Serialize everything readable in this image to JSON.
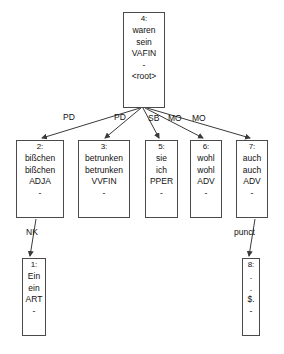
{
  "diagram": {
    "line_color": "#3a3a3a",
    "box_border_color": "#4a4a4a",
    "background": "#ffffff",
    "text_color": "#111111"
  },
  "nodes": [
    {
      "id": "node-4",
      "index": "4:",
      "form": "waren",
      "lemma": "sein",
      "pos": "VAFIN",
      "feats": "-",
      "deprel": "<root>",
      "x": 123,
      "y": 12,
      "w": 42,
      "h": 96
    },
    {
      "id": "node-2",
      "index": "2:",
      "form": "bißchen",
      "lemma": "bißchen",
      "pos": "ADJA",
      "feats": "-",
      "deprel": "",
      "x": 16,
      "y": 140,
      "w": 48,
      "h": 78
    },
    {
      "id": "node-3",
      "index": "3:",
      "form": "betrunken",
      "lemma": "betrunken",
      "pos": "VVFIN",
      "feats": "-",
      "deprel": "",
      "x": 78,
      "y": 140,
      "w": 52,
      "h": 78
    },
    {
      "id": "node-5",
      "index": "5:",
      "form": "sie",
      "lemma": "ich",
      "pos": "PPER",
      "feats": "-",
      "deprel": "",
      "x": 145,
      "y": 140,
      "w": 33,
      "h": 78
    },
    {
      "id": "node-6",
      "index": "6:",
      "form": "wohl",
      "lemma": "wohl",
      "pos": "ADV",
      "feats": "-",
      "deprel": "",
      "x": 190,
      "y": 140,
      "w": 32,
      "h": 78
    },
    {
      "id": "node-7",
      "index": "7:",
      "form": "auch",
      "lemma": "auch",
      "pos": "ADV",
      "feats": "-",
      "deprel": "",
      "x": 236,
      "y": 140,
      "w": 32,
      "h": 78
    },
    {
      "id": "node-1",
      "index": "1:",
      "form": "Ein",
      "lemma": "ein",
      "pos": "ART",
      "feats": "-",
      "deprel": "",
      "x": 22,
      "y": 258,
      "w": 24,
      "h": 78
    },
    {
      "id": "node-8",
      "index": "8:",
      "form": ".",
      "lemma": ".",
      "pos": "$.",
      "feats": "-",
      "deprel": "",
      "x": 242,
      "y": 258,
      "w": 18,
      "h": 78
    }
  ],
  "edges": [
    {
      "id": "edge-4-2",
      "label": "PD",
      "from": "node-4",
      "to": "node-2",
      "x1": 140,
      "y1": 108,
      "x2": 42,
      "y2": 138,
      "label_x": 63,
      "label_y": 112
    },
    {
      "id": "edge-4-3",
      "label": "PD",
      "from": "node-4",
      "to": "node-3",
      "x1": 141,
      "y1": 108,
      "x2": 105,
      "y2": 138,
      "label_x": 114,
      "label_y": 112
    },
    {
      "id": "edge-4-5",
      "label": "SB",
      "from": "node-4",
      "to": "node-5",
      "x1": 143,
      "y1": 108,
      "x2": 159,
      "y2": 138,
      "label_x": 148,
      "label_y": 113
    },
    {
      "id": "edge-4-6",
      "label": "MO",
      "from": "node-4",
      "to": "node-6",
      "x1": 145,
      "y1": 108,
      "x2": 203,
      "y2": 138,
      "label_x": 168,
      "label_y": 113
    },
    {
      "id": "edge-4-7",
      "label": "MO",
      "from": "node-4",
      "to": "node-7",
      "x1": 147,
      "y1": 108,
      "x2": 250,
      "y2": 138,
      "label_x": 192,
      "label_y": 113
    },
    {
      "id": "edge-2-1",
      "label": "NK",
      "from": "node-2",
      "to": "node-1",
      "x1": 36,
      "y1": 219,
      "x2": 30,
      "y2": 256,
      "label_x": 26,
      "label_y": 227
    },
    {
      "id": "edge-7-8",
      "label": "punct",
      "from": "node-7",
      "to": "node-8",
      "x1": 255,
      "y1": 219,
      "x2": 249,
      "y2": 256,
      "label_x": 234,
      "label_y": 227
    }
  ]
}
